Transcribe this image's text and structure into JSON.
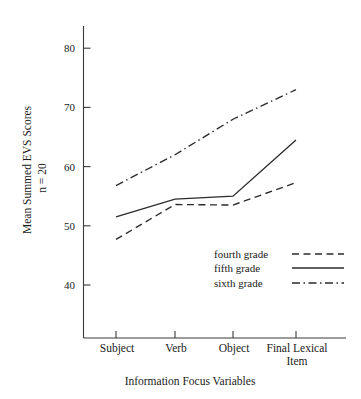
{
  "chart_data": {
    "type": "line",
    "title": "",
    "xlabel": "Information Focus Variables",
    "ylabel": "Mean Summed EVS Scores",
    "ylabel_note": "n = 20",
    "categories": [
      "Subject",
      "Verb",
      "Object",
      "Final Lexical Item"
    ],
    "category_lines": [
      [
        "Subject"
      ],
      [
        "Verb"
      ],
      [
        "Object"
      ],
      [
        "Final Lexical",
        "Item"
      ]
    ],
    "yticks": [
      40,
      50,
      60,
      70,
      80
    ],
    "ytick_labels": [
      "40",
      "50",
      "60",
      "70",
      "80"
    ],
    "ylim": [
      33,
      84
    ],
    "grid": false,
    "legend_position": "inside-lower-right",
    "series": [
      {
        "name": "fourth grade",
        "style": "dashed",
        "values": [
          47.7,
          53.6,
          53.5,
          57.3
        ]
      },
      {
        "name": "fifth grade",
        "style": "solid",
        "values": [
          51.5,
          54.5,
          55.0,
          64.5
        ]
      },
      {
        "name": "sixth grade",
        "style": "dash-dot",
        "values": [
          56.8,
          62.0,
          68.0,
          73.0
        ]
      }
    ],
    "legend": [
      {
        "label": "fourth grade",
        "style": "dashed"
      },
      {
        "label": "fifth grade",
        "style": "solid"
      },
      {
        "label": "sixth grade",
        "style": "dash-dot"
      }
    ],
    "colors": {
      "line": "#2b2b2b",
      "axis": "#3a3a3a",
      "text": "#1a1a1a",
      "background": "#ffffff"
    }
  }
}
